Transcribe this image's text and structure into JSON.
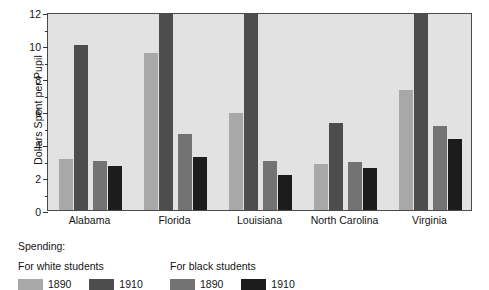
{
  "chart_data": {
    "type": "bar",
    "title": "",
    "xlabel": "",
    "ylabel": "Dollars Spent per Pupil",
    "ylim": [
      0,
      12
    ],
    "yticks": [
      0,
      2,
      4,
      6,
      8,
      10,
      12
    ],
    "ytick_labels": [
      "0",
      "2",
      "4",
      "6",
      "8",
      "10",
      "12"
    ],
    "minor_yticks": [
      1,
      3,
      5,
      7,
      9,
      11
    ],
    "grid": false,
    "legend_position": "below-plot",
    "categories": [
      "Alabama",
      "Florida",
      "Louisiana",
      "North Carolina",
      "Virginia"
    ],
    "series": [
      {
        "name": "For white students 1890",
        "group": "white",
        "year": "1890",
        "color": "#a8a8a8",
        "values": [
          3.1,
          9.5,
          5.9,
          2.8,
          7.3
        ]
      },
      {
        "name": "For white students 1910",
        "group": "white",
        "year": "1910",
        "color": "#4d4d4d",
        "values": [
          10.0,
          11.9,
          11.9,
          5.3,
          11.9
        ]
      },
      {
        "name": "For black students 1890",
        "group": "black",
        "year": "1890",
        "color": "#737373",
        "values": [
          3.0,
          4.6,
          3.0,
          2.9,
          5.1
        ]
      },
      {
        "name": "For black students 1910",
        "group": "black",
        "year": "1910",
        "color": "#1c1c1c",
        "values": [
          2.65,
          3.2,
          2.15,
          2.55,
          4.3
        ]
      }
    ]
  },
  "legend": {
    "title": "Spending:",
    "white_heading": "For white students",
    "black_heading": "For black students",
    "white_keys": [
      {
        "label": "1890",
        "color": "#a8a8a8"
      },
      {
        "label": "1910",
        "color": "#4d4d4d"
      }
    ],
    "black_keys": [
      {
        "label": "1890",
        "color": "#737373"
      },
      {
        "label": "1910",
        "color": "#1c1c1c"
      }
    ]
  },
  "style": {
    "plot_background": "#e2e2e2",
    "frame_color": "#4a4a4a",
    "page_background": "#ffffff",
    "text_color": "#151515"
  }
}
